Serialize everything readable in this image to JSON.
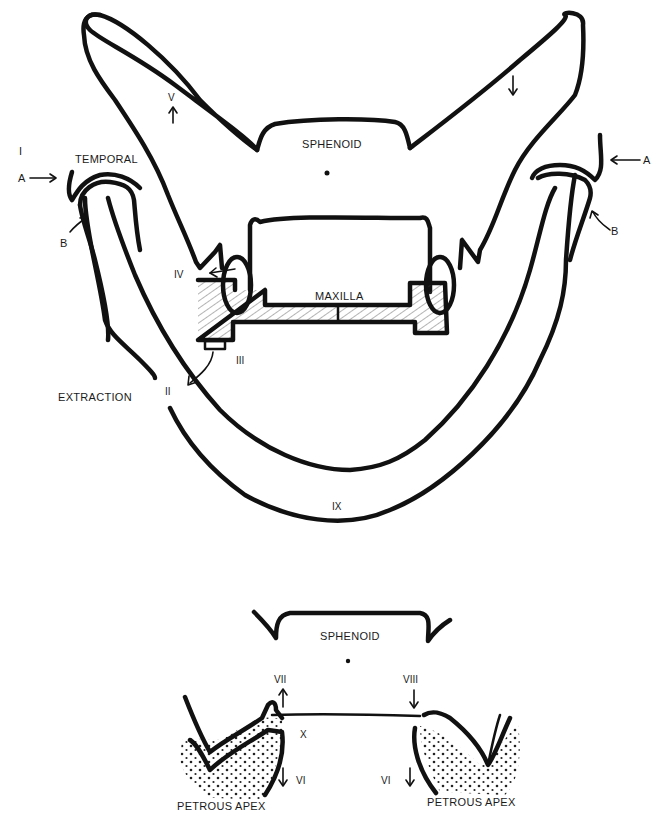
{
  "figure": {
    "top_diagram": {
      "labels": {
        "sphenoid": "SPHENOID",
        "temporal": "TEMPORAL",
        "maxilla": "MAXILLA",
        "extraction": "EXTRACTION",
        "roman_I": "I",
        "roman_II": "II",
        "roman_III": "III",
        "roman_IV": "IV",
        "roman_V": "V",
        "roman_IX": "IX",
        "left_A": "A",
        "left_B": "B",
        "right_A": "A",
        "right_B": "B"
      }
    },
    "bottom_diagram": {
      "labels": {
        "sphenoid": "SPHENOID",
        "roman_VII": "VII",
        "roman_VIII": "VIII",
        "roman_X": "X",
        "left_VI": "VI",
        "right_VI": "VI",
        "left_petrous": "PETROUS APEX",
        "right_petrous": "PETROUS APEX"
      }
    },
    "colors": {
      "ink": "#111111",
      "paper": "#ffffff"
    }
  }
}
